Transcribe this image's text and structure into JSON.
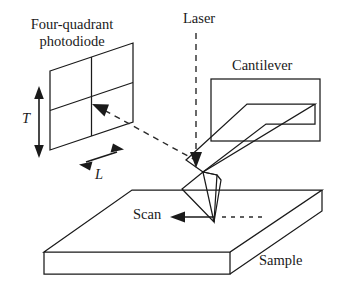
{
  "figure": {
    "width": 342,
    "height": 292,
    "background_color": "#ffffff",
    "line_color": "#1a1a1a"
  },
  "labels": {
    "photodiode_line1": "Four-quadrant",
    "photodiode_line2": "photodiode",
    "laser": "Laser",
    "cantilever": "Cantilever",
    "scan": "Scan",
    "sample": "Sample",
    "dimension_vertical": "T",
    "dimension_horizontal": "L"
  },
  "components": {
    "photodiode": {
      "name": "four-quadrant photodiode",
      "shape": "parallelogram",
      "quadrants": 4,
      "spot_marker": "laser-spot-arrowhead"
    },
    "laser": {
      "name": "laser beam",
      "style": "dashed vertical line with downward arrowhead"
    },
    "reflected_beam": {
      "name": "reflected laser beam",
      "style": "dashed diagonal line with arrowhead at photodiode center"
    },
    "cantilever": {
      "name": "cantilever chip and beam",
      "shape": "rectangle holder with diagonal beam and pyramidal tip"
    },
    "sample": {
      "name": "sample slab",
      "shape": "3d parallelepiped"
    },
    "scan_direction": {
      "name": "scan direction arrow",
      "style": "leftward arrow with dashed continuation"
    }
  }
}
